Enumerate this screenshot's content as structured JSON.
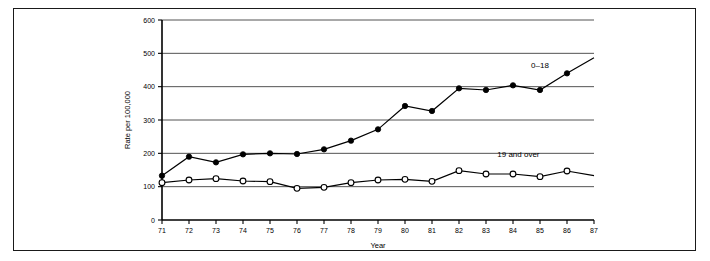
{
  "chart_data": {
    "type": "line",
    "title": "",
    "xlabel": "Year",
    "ylabel": "Rate per 100,000",
    "x": [
      71,
      72,
      73,
      74,
      75,
      76,
      77,
      78,
      79,
      80,
      81,
      82,
      83,
      84,
      85,
      86,
      87
    ],
    "xtick_labels": [
      "71",
      "72",
      "73",
      "74",
      "75",
      "76",
      "77",
      "78",
      "79",
      "80",
      "81",
      "82",
      "83",
      "84",
      "85",
      "86",
      "87"
    ],
    "ytick_labels": [
      "0",
      "100",
      "200",
      "300",
      "400",
      "500",
      "600"
    ],
    "ytick_values": [
      0,
      100,
      200,
      300,
      400,
      500,
      600
    ],
    "xlim": [
      71,
      87
    ],
    "ylim": [
      0,
      600
    ],
    "grid": "horizontal",
    "legend_position": "inline-right",
    "series": [
      {
        "name": "0-18",
        "label": "0–18",
        "marker": "filled-circle",
        "label_x": 85,
        "label_y": 455,
        "x": [
          71,
          72,
          73,
          74,
          75,
          76,
          77,
          78,
          79,
          80,
          81,
          82,
          83,
          84,
          85,
          86,
          87
        ],
        "values": [
          133,
          190,
          173,
          197,
          200,
          198,
          212,
          238,
          272,
          342,
          327,
          395,
          390,
          404,
          390,
          440,
          487
        ],
        "marker_x": [
          71,
          72,
          73,
          74,
          75,
          76,
          77,
          78,
          79,
          80,
          81,
          82,
          83,
          84,
          85,
          86
        ],
        "marker_values": [
          133,
          190,
          173,
          197,
          200,
          198,
          212,
          238,
          272,
          342,
          327,
          395,
          390,
          404,
          390,
          440
        ]
      },
      {
        "name": "19 and over",
        "label": "19 and over",
        "marker": "open-circle",
        "label_x": 84.2,
        "label_y": 188,
        "x": [
          71,
          72,
          73,
          74,
          75,
          76,
          77,
          78,
          79,
          80,
          81,
          82,
          83,
          84,
          85,
          86,
          87
        ],
        "values": [
          112,
          120,
          124,
          117,
          115,
          95,
          98,
          112,
          120,
          122,
          116,
          148,
          138,
          138,
          130,
          147,
          133
        ],
        "marker_x": [
          71,
          72,
          73,
          74,
          75,
          76,
          77,
          78,
          79,
          80,
          81,
          82,
          83,
          84,
          85,
          86
        ],
        "marker_values": [
          112,
          120,
          124,
          117,
          115,
          95,
          98,
          112,
          120,
          122,
          116,
          148,
          138,
          138,
          130,
          147
        ]
      }
    ]
  },
  "figure": {
    "border_color": "#1a1a1a",
    "line_color": "#000000",
    "background": "#ffffff"
  }
}
